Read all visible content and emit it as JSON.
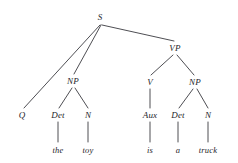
{
  "figure": {
    "type": "syntax-tree",
    "background_color": "#ffffff",
    "line_color": "#3a3a40",
    "text_color": "#25252a"
  },
  "nodes": {
    "s": {
      "label": "S",
      "x": 100,
      "y": 17
    },
    "q": {
      "label": "Q",
      "x": 22,
      "y": 115
    },
    "np_subject": {
      "label": "NP",
      "x": 73,
      "y": 81
    },
    "det_the": {
      "label": "Det",
      "x": 58,
      "y": 115
    },
    "n_toy": {
      "label": "N",
      "x": 88,
      "y": 115
    },
    "vp": {
      "label": "VP",
      "x": 175,
      "y": 48
    },
    "v": {
      "label": "V",
      "x": 150,
      "y": 82
    },
    "np_object": {
      "label": "NP",
      "x": 195,
      "y": 82
    },
    "aux": {
      "label": "Aux",
      "x": 150,
      "y": 115
    },
    "det_a": {
      "label": "Det",
      "x": 178,
      "y": 115
    },
    "n_truck": {
      "label": "N",
      "x": 208,
      "y": 115
    }
  },
  "words": {
    "the": {
      "text": "the",
      "x": 58,
      "y": 150
    },
    "toy": {
      "text": "toy",
      "x": 88,
      "y": 150
    },
    "is": {
      "text": "is",
      "x": 150,
      "y": 150
    },
    "a": {
      "text": "a",
      "x": 178,
      "y": 150
    },
    "truck": {
      "text": "truck",
      "x": 208,
      "y": 150
    }
  },
  "edges": [
    {
      "name": "s-to-q",
      "x1": 100,
      "y1": 25,
      "x2": 24,
      "y2": 108
    },
    {
      "name": "s-to-np",
      "x1": 101,
      "y1": 25,
      "x2": 74,
      "y2": 74
    },
    {
      "name": "s-to-vp",
      "x1": 102,
      "y1": 25,
      "x2": 174,
      "y2": 41
    },
    {
      "name": "np-to-det",
      "x1": 72,
      "y1": 88,
      "x2": 59,
      "y2": 108
    },
    {
      "name": "np-to-n",
      "x1": 75,
      "y1": 88,
      "x2": 88,
      "y2": 108
    },
    {
      "name": "det-to-the",
      "x1": 58,
      "y1": 122,
      "x2": 58,
      "y2": 142
    },
    {
      "name": "n-to-toy",
      "x1": 88,
      "y1": 122,
      "x2": 88,
      "y2": 142
    },
    {
      "name": "vp-to-v",
      "x1": 173,
      "y1": 55,
      "x2": 151,
      "y2": 75
    },
    {
      "name": "vp-to-np",
      "x1": 177,
      "y1": 55,
      "x2": 194,
      "y2": 75
    },
    {
      "name": "v-to-aux",
      "x1": 150,
      "y1": 89,
      "x2": 150,
      "y2": 108
    },
    {
      "name": "npo-to-det",
      "x1": 193,
      "y1": 89,
      "x2": 179,
      "y2": 108
    },
    {
      "name": "npo-to-n",
      "x1": 197,
      "y1": 89,
      "x2": 208,
      "y2": 108
    },
    {
      "name": "aux-to-is",
      "x1": 150,
      "y1": 122,
      "x2": 150,
      "y2": 142
    },
    {
      "name": "deta-to-a",
      "x1": 178,
      "y1": 122,
      "x2": 178,
      "y2": 142
    },
    {
      "name": "ntruck-to-truck",
      "x1": 208,
      "y1": 122,
      "x2": 208,
      "y2": 142
    }
  ]
}
